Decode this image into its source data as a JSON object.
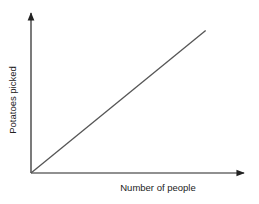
{
  "chart_data": {
    "type": "line",
    "title": "",
    "xlabel": "Number of people",
    "ylabel": "Potatoes picked",
    "x_ticks": [],
    "y_ticks": [],
    "grid": false,
    "legend": null,
    "series": [
      {
        "name": "Potatoes picked vs number of people",
        "description": "Straight line through the origin with constant positive slope (direct proportion)",
        "points": [
          {
            "x": 0,
            "y": 0
          },
          {
            "x": 0.82,
            "y": 0.89
          }
        ]
      }
    ],
    "xlim": [
      0,
      1
    ],
    "ylim": [
      0,
      1
    ]
  },
  "colors": {
    "axis": "#222222",
    "line": "#555555",
    "text": "#222222",
    "background": "#ffffff"
  }
}
